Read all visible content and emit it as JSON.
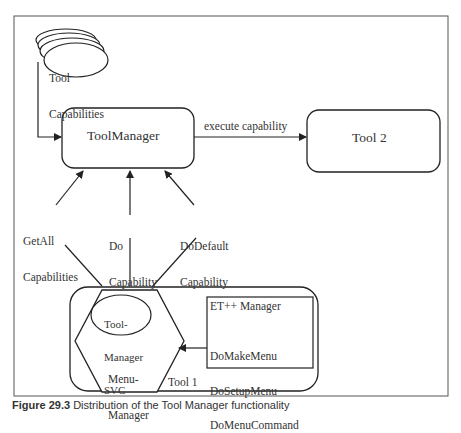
{
  "figure": {
    "nodes": {
      "tool_capabilities": {
        "line1": "Tool",
        "line2": "Capabilities"
      },
      "tool_manager": {
        "label": "ToolManager"
      },
      "tool2": {
        "label": "Tool 2"
      },
      "tool1": {
        "label": "Tool 1"
      },
      "tool_manager_svc": {
        "line1": "Tool-",
        "line2": "Manager",
        "line3": "SVC"
      },
      "menu_manager": {
        "line1": "Menu-",
        "line2": "Manager"
      },
      "etpp_manager": {
        "title": "ET++ Manager",
        "methods": [
          "DoMakeMenu",
          "DoSetupMenu",
          "DoMenuCommand"
        ]
      }
    },
    "edges": {
      "execute": {
        "label": "execute capability"
      },
      "get_all": {
        "line1": "GetAll",
        "line2": "Capabilities"
      },
      "do_capability": {
        "line1": "Do",
        "line2": "Capability"
      },
      "do_default": {
        "line1": "DoDefault",
        "line2": "Capability"
      }
    },
    "caption": {
      "number": "Figure 29.3",
      "text": "Distribution of the Tool Manager functionality"
    }
  }
}
